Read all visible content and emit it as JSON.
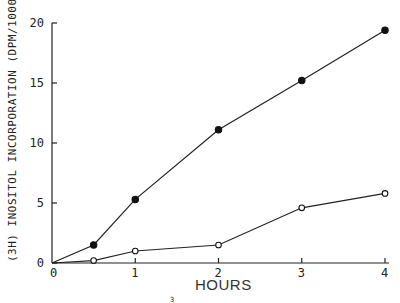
{
  "chart_data": {
    "type": "line",
    "title": "",
    "xlabel": "HOURS",
    "ylabel": "(3H) INOSITOL INCORPORATION (DPM/1000)",
    "xlim": [
      0,
      4
    ],
    "ylim": [
      0,
      20
    ],
    "x_ticks": [
      "0",
      "1",
      "2",
      "3",
      "4"
    ],
    "y_ticks": [
      "0",
      "5",
      "10",
      "15",
      "20"
    ],
    "grid": false,
    "legend": null,
    "series": [
      {
        "name": "filled circles",
        "marker": "filled-circle",
        "x": [
          0,
          0.5,
          1,
          2,
          3,
          4
        ],
        "values": [
          0,
          1.5,
          5.3,
          11.1,
          15.2,
          19.4
        ]
      },
      {
        "name": "open circles",
        "marker": "open-circle",
        "x": [
          0,
          0.5,
          1,
          2,
          3,
          4
        ],
        "values": [
          0,
          0.2,
          1.0,
          1.5,
          4.6,
          5.8
        ]
      }
    ],
    "annotations": [
      "3"
    ]
  },
  "footnote_mark": "3"
}
